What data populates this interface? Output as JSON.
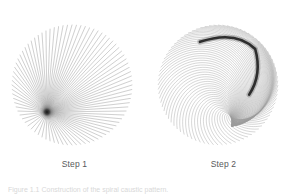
{
  "figures": [
    {
      "id": "step-1",
      "label": "Step 1",
      "icon_name": "radial-burst-diagram",
      "description": "Circular fan of straight chords converging to a dark focal point below-left of centre",
      "line_color": "#9a9a9a",
      "accent_color": "#101010",
      "geometry": {
        "center_x": 72,
        "center_y": 85,
        "radius": 60,
        "focus_x": 47,
        "focus_y": 112,
        "ray_count": 84
      }
    },
    {
      "id": "step-2",
      "label": "Step 2",
      "icon_name": "spiral-caustic-diagram",
      "description": "Same family of lines bent into concentric spiral arcs with a dark caustic envelope in the upper right",
      "line_color": "#9a9a9a",
      "accent_color": "#101010",
      "geometry": {
        "center_x": 69,
        "center_y": 85,
        "radius": 60,
        "arc_count": 84,
        "twist": 1.0
      }
    }
  ],
  "caption": {
    "text": "Figure 1.1  Construction of the spiral caustic pattern."
  },
  "chart_data": {
    "type": "line",
    "title": "",
    "xlabel": "",
    "ylabel": "",
    "panels": [
      {
        "name": "Step 1",
        "series_count": 84,
        "shape": "straight-chords",
        "focus": [
          47,
          112
        ]
      },
      {
        "name": "Step 2",
        "series_count": 84,
        "shape": "spiral-arcs",
        "focus": [
          225,
          55
        ]
      }
    ]
  }
}
